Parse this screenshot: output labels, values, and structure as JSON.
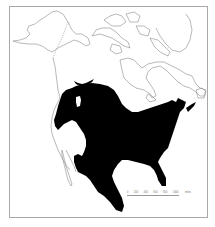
{
  "map": {
    "type": "range-map",
    "region": "North America",
    "colors": {
      "range_fill": "#000000",
      "coastline": "#8a8a8a",
      "border": "#a8a8a8",
      "background": "#ffffff"
    },
    "legend": {
      "scale_labels": [
        "0",
        "200",
        "400",
        "600",
        "800",
        "1000"
      ],
      "scale_unit": "miles"
    }
  }
}
